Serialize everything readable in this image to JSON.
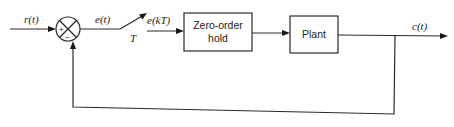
{
  "diagram": {
    "type": "sampled-data closed-loop control block diagram",
    "signals": {
      "input": "r(t)",
      "error": "e(t)",
      "sampled_error": "e(kT)",
      "sample_period": "T",
      "output": "c(t)"
    },
    "summing_junction": {
      "plus_sign": "+",
      "minus_sign": "−"
    },
    "blocks": {
      "zoh": {
        "line1": "Zero-order",
        "line2": "hold"
      },
      "plant": {
        "label": "Plant"
      }
    },
    "colors": {
      "stroke": "#2a2a2a",
      "background": "#ffffff"
    }
  }
}
